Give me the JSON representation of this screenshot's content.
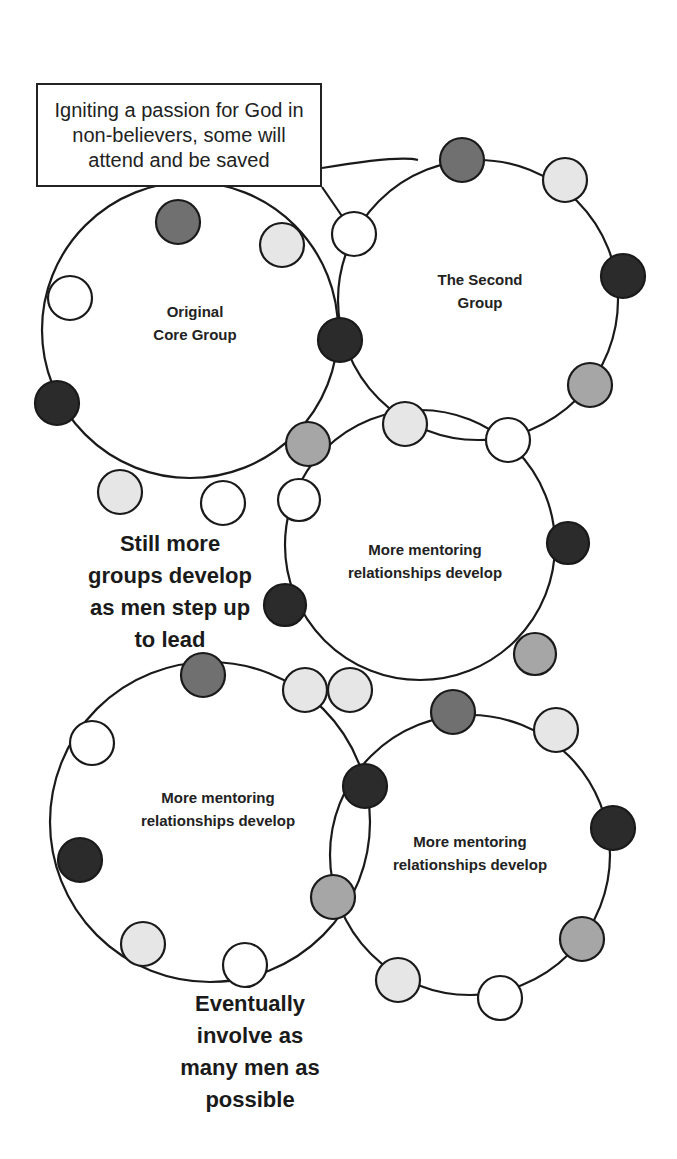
{
  "callout": {
    "text": "Igniting a passion for God in non-believers, some will attend and be saved"
  },
  "groups": [
    {
      "id": "original",
      "label": "Original Core Group",
      "line1": "Original",
      "line2": "Core Group",
      "cx": 190,
      "cy": 330,
      "r": 148
    },
    {
      "id": "second",
      "label": "The Second Group",
      "line1": "The Second",
      "line2": "Group",
      "cx": 478,
      "cy": 300,
      "r": 140
    },
    {
      "id": "middle",
      "label": "More mentoring relationships develop",
      "line1": "More mentoring",
      "line2": "relationships develop",
      "cx": 420,
      "cy": 545,
      "r": 135
    },
    {
      "id": "bottom-left",
      "label": "More mentoring relationships develop",
      "line1": "More mentoring",
      "line2": "relationships develop",
      "cx": 210,
      "cy": 822,
      "r": 160
    },
    {
      "id": "bottom-right",
      "label": "More mentoring relationships develop",
      "line1": "More mentoring",
      "line2": "relationships develop",
      "cx": 470,
      "cy": 855,
      "r": 140
    }
  ],
  "notes": {
    "still_more": [
      "Still more",
      "groups develop",
      "as men step up",
      "to lead"
    ],
    "eventually": [
      "Eventually",
      "involve as",
      "many men as",
      "possible"
    ]
  },
  "node_colors": {
    "white": "#ffffff",
    "light": "#e6e6e6",
    "medium": "#a6a6a6",
    "dark": "#707070",
    "black": "#2b2b2b"
  }
}
